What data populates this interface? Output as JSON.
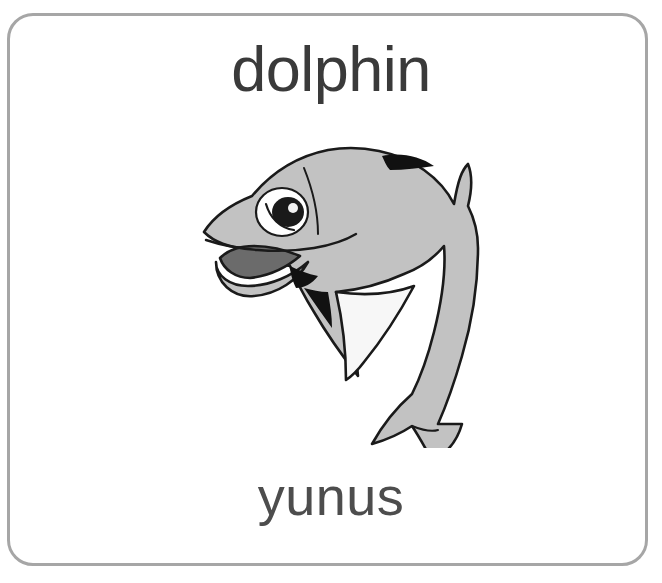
{
  "card": {
    "word_english": "dolphin",
    "word_turkish": "yunus",
    "border_color": "#a6a6a6",
    "background_color": "#ffffff",
    "text_color_english": "#3a3a3a",
    "text_color_turkish": "#4d4d4d"
  },
  "illustration": {
    "name": "dolphin-illustration",
    "subject": "dolphin",
    "style": "clip-art",
    "pose": "leaping, facing left",
    "body_color": "#c2c2c2",
    "outline_color": "#1a1a1a",
    "belly_color": "#ffffff",
    "mouth_color": "#5c5c5c",
    "eye_color": "#111111",
    "marking_color": "#111111"
  }
}
